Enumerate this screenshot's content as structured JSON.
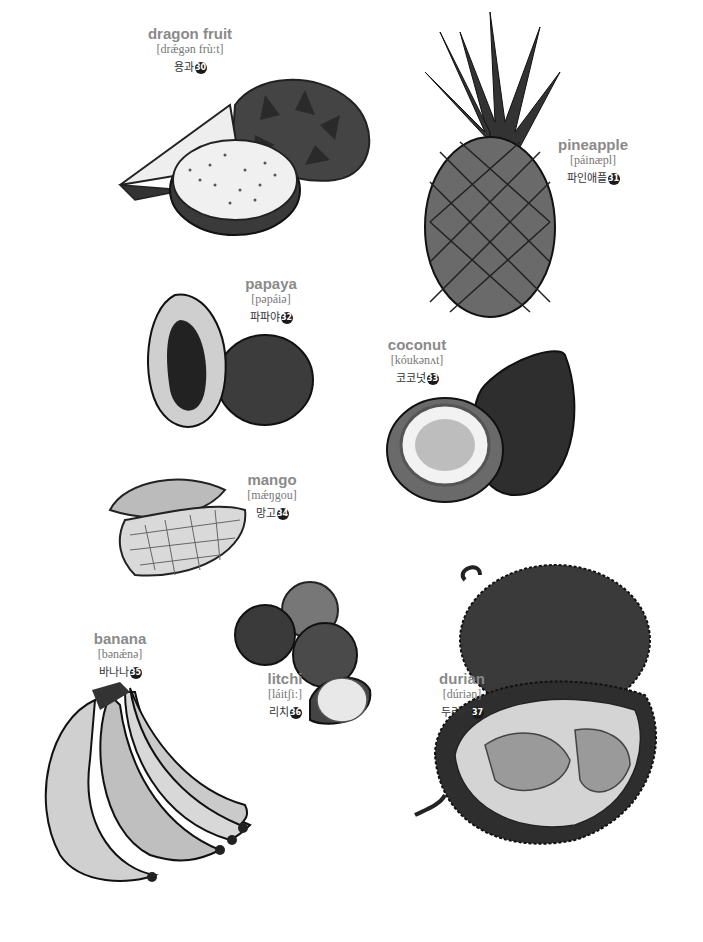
{
  "page": {
    "entries": [
      {
        "key": "dragon_fruit",
        "english": "dragon fruit",
        "ipa": "[drǽgən frù:t]",
        "korean": "용과",
        "number": "30"
      },
      {
        "key": "pineapple",
        "english": "pineapple",
        "ipa": "[páinæpl]",
        "korean": "파인애플",
        "number": "31"
      },
      {
        "key": "papaya",
        "english": "papaya",
        "ipa": "[pəpáiə]",
        "korean": "파파야",
        "number": "32"
      },
      {
        "key": "coconut",
        "english": "coconut",
        "ipa": "[kóukənʌt]",
        "korean": "코코넛",
        "number": "33"
      },
      {
        "key": "mango",
        "english": "mango",
        "ipa": "[mǽŋgou]",
        "korean": "망고",
        "number": "34"
      },
      {
        "key": "banana",
        "english": "banana",
        "ipa": "[bənǽnə]",
        "korean": "바나나",
        "number": "35"
      },
      {
        "key": "litchi",
        "english": "litchi",
        "ipa": "[láitʃi:]",
        "korean": "리치",
        "number": "36"
      },
      {
        "key": "durian",
        "english": "durian",
        "ipa": "[dúriən]",
        "korean": "두리안",
        "number": "37"
      }
    ]
  },
  "colors": {
    "label_english": "#8a8a8a",
    "label_ipa": "#777777",
    "badge": "#1a1a1a"
  }
}
